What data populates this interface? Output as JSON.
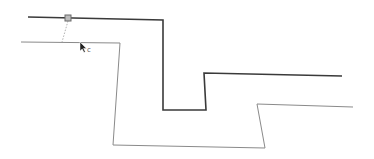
{
  "canvas": {
    "background": "#ffffff",
    "width": 374,
    "height": 159
  },
  "source_path": {
    "color": "#3a3a3a",
    "stroke_width": 1.6,
    "points": "28,17 163,20 163,110 206,110 204,73 342,76"
  },
  "offset_path": {
    "color": "#8a8a8a",
    "stroke_width": 1,
    "points": "21,42 120,43 113,145 265,148 257,104 353,107"
  },
  "handle": {
    "x": 65,
    "y": 15,
    "size": 6,
    "fill": "#bdbdbd",
    "stroke": "#6a6a6a"
  },
  "connector": {
    "color": "#a0a0a0",
    "x1": 68,
    "y1": 21,
    "x2": 62,
    "y2": 42
  },
  "cursor": {
    "icon": "arrow-cursor-icon",
    "x": 80,
    "y": 42,
    "label": "c",
    "label_x": 87,
    "label_y": 47
  }
}
